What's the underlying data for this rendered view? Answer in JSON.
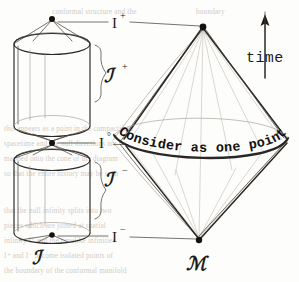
{
  "figure": {
    "caption_banner": "Consider as one point",
    "time_axis_label": "time"
  },
  "labels": {
    "scri_plus_base": "ℐ",
    "scri_plus_sup": "+",
    "scri_minus_base": "ℐ",
    "scri_minus_sup": "−",
    "scri_plain": "ℐ",
    "manifold": "ℳ",
    "i_plus_base": "I",
    "i_plus_sup": "+",
    "i_zero_base": "I",
    "i_zero_sup": "°",
    "i_minus_base": "I",
    "i_minus_sup": "−",
    "i_zero_dash": "—"
  },
  "colors": {
    "ink": "#2b2724",
    "ink_light": "#4a443f",
    "faint_ray": "#a9a39d",
    "ghost_ray": "#c3bdb7",
    "paper": "#fdfdfc",
    "showthrough": "#cfcbc6",
    "vertex": "#15110f"
  },
  "showthrough_lines": [
    {
      "x": 52,
      "y": 14,
      "text": "conformal structure and the"
    },
    {
      "x": 196,
      "y": 14,
      "text": "boundary"
    },
    {
      "x": 4,
      "y": 131,
      "text": "this  appears  as  a  point  in  the  compactified"
    },
    {
      "x": 4,
      "y": 146,
      "text": "spacetime  and  the  null  directions  are"
    },
    {
      "x": 4,
      "y": 161,
      "text": "mapped  onto  the  cone  of  the  diagram"
    },
    {
      "x": 4,
      "y": 176,
      "text": "so  that  the  entire  history  may  be  seen"
    },
    {
      "x": 4,
      "y": 213,
      "text": "that  the  null  infinity  splits  into  two"
    },
    {
      "x": 4,
      "y": 228,
      "text": "pieces  which  are  joined  at  spatial"
    },
    {
      "x": 4,
      "y": 243,
      "text": "infinity  I°  and  the  timelike  infinities"
    },
    {
      "x": 4,
      "y": 258,
      "text": "I⁺  and  I⁻  become  isolated  points  of"
    },
    {
      "x": 4,
      "y": 273,
      "text": "the  boundary  of  the  conformal  manifold"
    }
  ],
  "structures": {
    "upper_cylinder": {
      "name": "upper-cylinder",
      "top_center_y": 42,
      "bottom_center_y": 135,
      "cx": 52,
      "rx": 39,
      "ry": 11
    },
    "lower_cylinder": {
      "name": "lower-cylinder",
      "top_center_y": 152,
      "bottom_center_y": 243,
      "cx": 52,
      "rx": 39,
      "ry": 11
    },
    "diamond": {
      "name": "penrose-diamond",
      "apex_x": 203,
      "apex_y": 27,
      "bottom_x": 199,
      "bottom_y": 240,
      "left_x": 112,
      "right_x": 288,
      "equator_y": 142
    },
    "vertices": [
      {
        "name": "i-plus-vertex",
        "x": 52,
        "y": 18
      },
      {
        "name": "i-zero-vertex",
        "x": 52,
        "y": 143
      },
      {
        "name": "i-minus-vertex",
        "x": 52,
        "y": 235
      },
      {
        "name": "diamond-apex-vertex",
        "x": 203,
        "y": 27
      },
      {
        "name": "diamond-bottom-vertex",
        "x": 199,
        "y": 240
      }
    ]
  }
}
